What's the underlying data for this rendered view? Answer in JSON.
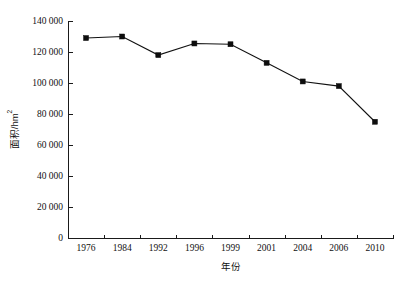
{
  "chart_data": {
    "type": "line",
    "title": "",
    "subtitle": "",
    "xlabel": "年份",
    "ylabel": "面积/hm",
    "ylabel_unit_superscript": "2",
    "categories": [
      "1976",
      "1984",
      "1992",
      "1996",
      "1999",
      "2001",
      "2004",
      "2006",
      "2010"
    ],
    "series": [
      {
        "name": "面积",
        "values": [
          129000,
          130000,
          118000,
          125500,
          125000,
          113000,
          101000,
          98000,
          75000
        ]
      }
    ],
    "ylim": [
      0,
      140000
    ],
    "ytick_values": [
      0,
      20000,
      40000,
      60000,
      80000,
      100000,
      120000,
      140000
    ],
    "ytick_labels": [
      "0",
      "20 000",
      "40 000",
      "60 000",
      "80 000",
      "100 000",
      "120 000",
      "140 000"
    ],
    "grid": false,
    "legend": "none",
    "marker_style": "square",
    "line_color": "#111111",
    "marker_color": "#0d0d0d",
    "axis_color": "#1a1a1a",
    "background_color": "#ffffff"
  },
  "layout": {
    "plot_left": 68,
    "plot_right": 393,
    "plot_top": 21,
    "plot_bottom": 238
  }
}
